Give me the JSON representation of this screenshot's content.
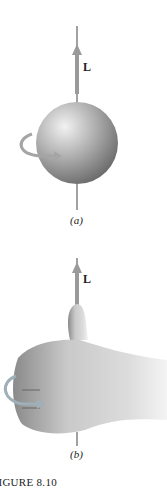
{
  "figure": {
    "panel_a": {
      "vector_label": "L",
      "sublabel": "(a)"
    },
    "panel_b": {
      "vector_label": "L",
      "sublabel": "(b)"
    },
    "caption": "FIGURE 8.10"
  },
  "colors": {
    "axis_line": "#444444",
    "arrow_fill": "#9a9a9a",
    "sphere_light": "#e6e6e6",
    "sphere_dark": "#6e6e6e",
    "skin_light": "#e4e4e4",
    "skin_dark": "#8a8a8a"
  }
}
